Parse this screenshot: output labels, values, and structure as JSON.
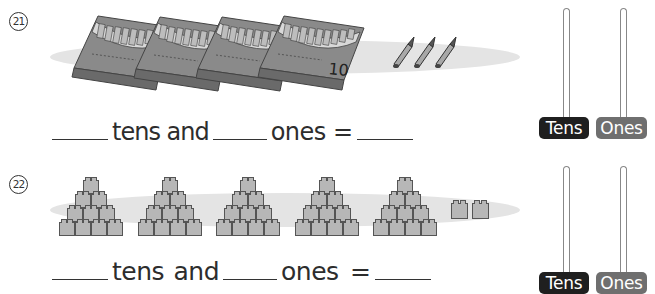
{
  "problems": [
    {
      "number": "21",
      "number_glyph": "㉑",
      "objects": {
        "kind": "crayon-boxes",
        "tens_groups": 4,
        "tens_group_label": "10",
        "loose_ones": 3
      },
      "sentence": {
        "part1": "tens and",
        "part2": "ones ="
      },
      "abacus": {
        "tens_label": "Tens",
        "ones_label": "Ones"
      }
    },
    {
      "number": "22",
      "number_glyph": "㉒",
      "objects": {
        "kind": "block-pyramids",
        "tens_groups": 5,
        "loose_ones": 2
      },
      "sentence": {
        "part1": "tens and",
        "part2": "ones ="
      },
      "abacus": {
        "tens_label": "Tens",
        "ones_label": "Ones"
      }
    }
  ],
  "colors": {
    "tens_pill": "#1f1f1f",
    "ones_pill": "#6f6f6f",
    "shadow": "#e4e4e4",
    "crayon_box": "#8a8a8a",
    "block": "#b7b7b7"
  }
}
